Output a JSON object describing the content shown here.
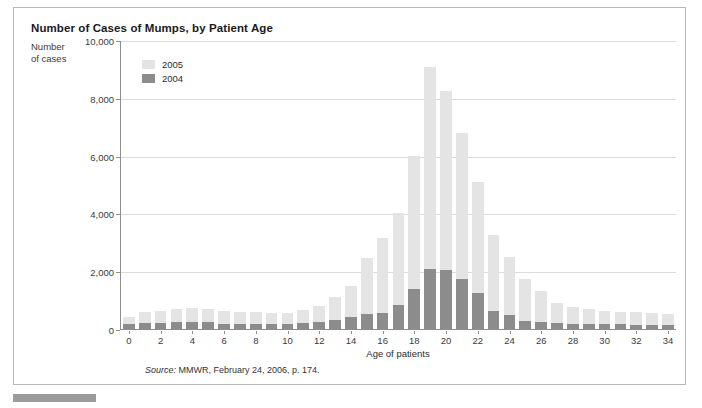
{
  "figure": {
    "title": "Number of Cases of Mumps, by Patient Age",
    "y_axis_label_line1": "Number",
    "y_axis_label_line2": "of cases",
    "x_axis_title": "Age of patients",
    "source_word": "Source:",
    "source_text": " MMWR, February 24, 2006, p. 174."
  },
  "legend": {
    "position": "top-left-inside",
    "entries": [
      {
        "label": "2005",
        "color": "#e4e4e4"
      },
      {
        "label": "2004",
        "color": "#8c8c8c"
      }
    ]
  },
  "colors": {
    "series_2005": "#e4e4e4",
    "series_2004": "#8c8c8c",
    "gridline": "#dcdcdc",
    "axis": "#8e8e8e",
    "frame_border": "#b9b9b9",
    "footer_bar": "#9b9b9b"
  },
  "chart_data": {
    "type": "bar",
    "stacked": true,
    "title": "Number of Cases of Mumps, by Patient Age",
    "xlabel": "Age of patients",
    "ylabel": "Number of cases",
    "ylim": [
      0,
      10000
    ],
    "yticks": [
      0,
      2000,
      4000,
      6000,
      8000,
      10000
    ],
    "ytick_labels": [
      "0",
      "2,000",
      "4,000",
      "6,000",
      "8,000",
      "10,000"
    ],
    "grid": true,
    "xlim": [
      -0.5,
      34.5
    ],
    "xticks": [
      0,
      2,
      4,
      6,
      8,
      10,
      12,
      14,
      16,
      18,
      20,
      22,
      24,
      26,
      28,
      30,
      32,
      34
    ],
    "xtick_labels": [
      "0",
      "2",
      "4",
      "6",
      "8",
      "10",
      "12",
      "14",
      "16",
      "18",
      "20",
      "22",
      "24",
      "26",
      "28",
      "30",
      "32",
      "34"
    ],
    "categories": [
      0,
      1,
      2,
      3,
      4,
      5,
      6,
      7,
      8,
      9,
      10,
      11,
      12,
      13,
      14,
      15,
      16,
      17,
      18,
      19,
      20,
      21,
      22,
      23,
      24,
      25,
      26,
      27,
      28,
      29,
      30,
      31,
      32,
      33,
      34
    ],
    "series": [
      {
        "name": "2004",
        "color": "#8c8c8c",
        "values": [
          180,
          200,
          200,
          230,
          240,
          230,
          190,
          180,
          180,
          180,
          180,
          200,
          230,
          300,
          420,
          520,
          560,
          820,
          1400,
          2100,
          2050,
          1750,
          1250,
          620,
          500,
          280,
          230,
          200,
          180,
          170,
          160,
          160,
          150,
          150,
          150
        ]
      },
      {
        "name": "2005",
        "color": "#e4e4e4",
        "values": [
          250,
          400,
          410,
          480,
          480,
          450,
          420,
          420,
          420,
          360,
          380,
          470,
          580,
          800,
          1060,
          1950,
          2610,
          3220,
          4600,
          7000,
          6200,
          5050,
          3850,
          2650,
          2000,
          1440,
          1100,
          720,
          600,
          520,
          480,
          440,
          430,
          400,
          380
        ]
      }
    ],
    "totals": [
      430,
      600,
      610,
      710,
      720,
      680,
      610,
      600,
      600,
      540,
      560,
      670,
      810,
      1100,
      1480,
      2470,
      3170,
      4040,
      6000,
      9100,
      8250,
      6800,
      5100,
      3270,
      2500,
      1720,
      1330,
      920,
      780,
      690,
      640,
      600,
      580,
      550,
      530
    ]
  }
}
